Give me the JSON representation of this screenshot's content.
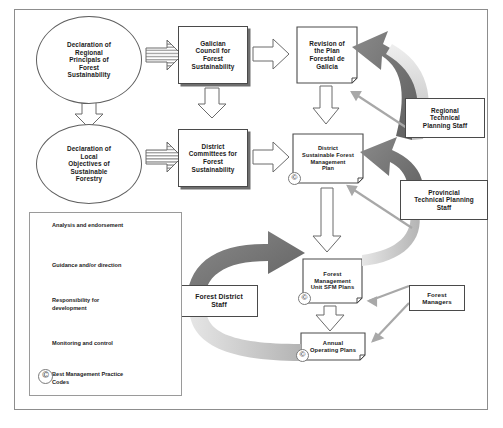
{
  "diagram": {
    "nodes": {
      "regional_declaration": "Declaration of Regional Principals of Forest Sustainability",
      "local_declaration": "Declaration of Local Objectives of Sustainable Forestry",
      "galician_council": "Galician Council for Forest Sustainability",
      "district_committees": "District Committees for Forest Sustainability",
      "plan_revision": "Revision of the Plan Forestal de Galicia",
      "district_sfm_plan": "District Sustainable Forest Management Plan",
      "fmu_sfm_plans": "Forest Management Unit SFM Plans",
      "annual_operating_plans": "Annual Operating Plans",
      "regional_staff": "Regional Technical Planning Staff",
      "provincial_staff": "Provincial Technical Planning Staff",
      "forest_district_staff": "Forest District Staff",
      "forest_managers": "Forest Managers"
    },
    "node_lines": {
      "regional_declaration": [
        "Declaration of",
        "Regional",
        "Principals of",
        "Forest",
        "Sustainability"
      ],
      "local_declaration": [
        "Declaration of",
        "Local",
        "Objectives of",
        "Sustainable",
        "Forestry"
      ],
      "galician_council": [
        "Galician",
        "Council for",
        "Forest",
        "Sustainability"
      ],
      "district_committees": [
        "District",
        "Committees for",
        "Forest",
        "Sustainability"
      ],
      "plan_revision": [
        "Revision of",
        "the Plan",
        "Forestal de",
        "Galicia"
      ],
      "district_sfm_plan": [
        "District",
        "Sustainable Forest",
        "Management",
        "Plan"
      ],
      "fmu_sfm_plans": [
        "Forest",
        "Management",
        "Unit SFM Plans"
      ],
      "annual_operating_plans": [
        "Annual",
        "Operating Plans"
      ],
      "regional_staff": [
        "Regional",
        "Technical",
        "Planning Staff"
      ],
      "provincial_staff": [
        "Provincial",
        "Technical Planning",
        "Staff"
      ],
      "forest_district_staff": [
        "Forest District",
        "Staff"
      ],
      "forest_managers": [
        "Forest",
        "Managers"
      ]
    },
    "legend": {
      "items": [
        {
          "icon": "striped-down-arrow-icon",
          "label": "Analysis and endorsement"
        },
        {
          "icon": "hollow-down-arrow-icon",
          "label": "Guidance and/or direction"
        },
        {
          "icon": "hatched-down-arrow-icon",
          "label_line1": "Responsibility for",
          "label_line2": "development"
        },
        {
          "icon": "curved-arrow-icon",
          "label": "Monitoring and control"
        },
        {
          "icon": "copyright-circle-icon",
          "label_line1": "Best Management Practice",
          "label_line2": "Codes"
        }
      ]
    },
    "colors": {
      "frame_border": "#8d8d8d",
      "box_border": "#4a4a4a",
      "arrow_fill": "#ffffff",
      "arrow_stroke": "#6a6a6a",
      "curved_arrow_dark": "#6b6b6b",
      "curved_arrow_light": "#c9c9c9",
      "bmp_mark": "#7a7a7a",
      "text": "#1a1a1a"
    },
    "bmp_marks": [
      "district_sfm_plan",
      "fmu_sfm_plans",
      "annual_operating_plans"
    ]
  }
}
